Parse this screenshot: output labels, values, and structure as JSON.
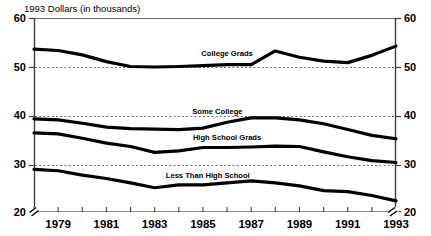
{
  "chart_data": {
    "type": "line",
    "title": "1993 Dollars (in thousands)",
    "xlabel": "",
    "ylabel": "",
    "ylim": [
      20,
      60
    ],
    "xlim": [
      1978,
      1993
    ],
    "grid": true,
    "grid_values": [
      50,
      40,
      30
    ],
    "axis_break": true,
    "legend": "inline-labels",
    "y_ticks": [
      "60",
      "50",
      "40",
      "30",
      "20"
    ],
    "y_tick_values": [
      60,
      50,
      40,
      30,
      20
    ],
    "y_axis_right_ticks": [
      "60",
      "50",
      "40",
      "30",
      "20"
    ],
    "x": [
      1978,
      1979,
      1980,
      1981,
      1982,
      1983,
      1984,
      1985,
      1986,
      1987,
      1988,
      1989,
      1990,
      1991,
      1992,
      1993
    ],
    "x_tick_labels": [
      "1979",
      "1981",
      "1983",
      "1985",
      "1987",
      "1989",
      "1991",
      "1993"
    ],
    "x_tick_label_values": [
      1979,
      1981,
      1983,
      1985,
      1987,
      1989,
      1991,
      1993
    ],
    "series": [
      {
        "name": "College Grads",
        "label": "College Grads",
        "values": [
          53.6,
          53.3,
          52.4,
          51.0,
          50.0,
          49.9,
          50.0,
          50.2,
          50.4,
          50.4,
          53.2,
          51.9,
          51.1,
          50.8,
          52.3,
          54.2
        ]
      },
      {
        "name": "Some College",
        "label": "Some College",
        "values": [
          39.2,
          39.0,
          38.3,
          37.5,
          37.2,
          37.1,
          37.0,
          37.3,
          38.5,
          39.4,
          39.4,
          39.0,
          38.2,
          37.0,
          35.8,
          35.1
        ]
      },
      {
        "name": "High School Grads",
        "label": "High School Grads",
        "values": [
          36.3,
          36.1,
          35.2,
          34.2,
          33.5,
          32.3,
          32.6,
          33.3,
          33.3,
          33.4,
          33.6,
          33.5,
          32.4,
          31.4,
          30.6,
          30.2
        ]
      },
      {
        "name": "Less Than High School",
        "label": "Less Than High School",
        "values": [
          28.8,
          28.5,
          27.6,
          26.9,
          26.0,
          25.0,
          25.6,
          25.6,
          26.0,
          26.4,
          26.0,
          25.4,
          24.4,
          24.2,
          23.4,
          22.3
        ]
      }
    ],
    "colors": {
      "line": "#000000",
      "axis": "#4d4d4d",
      "grid": "#7a7a7a",
      "background": "#ffffff"
    }
  }
}
